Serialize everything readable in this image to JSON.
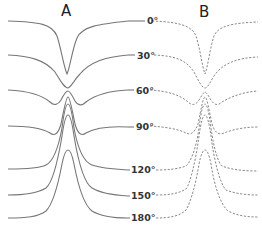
{
  "chart_data": {
    "type": "line",
    "title": "",
    "panels": [
      {
        "id": "A",
        "label": "A",
        "style": "solid",
        "description": "measured spectra"
      },
      {
        "id": "B",
        "label": "B",
        "style": "dashed",
        "description": "simulated spectra"
      }
    ],
    "xlabel": "",
    "ylabel": "",
    "grid": false,
    "legend": "none",
    "series_labels": [
      "0°",
      "30°",
      "60°",
      "90°",
      "120°",
      "150°",
      "180°"
    ],
    "series": [
      {
        "name": "0°",
        "shape": "dip",
        "depth": 1.0,
        "baseline_y": 21
      },
      {
        "name": "30°",
        "shape": "dip",
        "depth": 0.6,
        "baseline_y": 55
      },
      {
        "name": "60°",
        "shape": "dip-peak",
        "depth": 0.3,
        "baseline_y": 90
      },
      {
        "name": "90°",
        "shape": "peak",
        "height": 0.9,
        "baseline_y": 126
      },
      {
        "name": "120°",
        "shape": "peak",
        "height": 1.0,
        "baseline_y": 169
      },
      {
        "name": "150°",
        "shape": "peak",
        "height": 1.0,
        "baseline_y": 195
      },
      {
        "name": "180°",
        "shape": "peak",
        "height": 0.9,
        "baseline_y": 218
      }
    ]
  },
  "panel_a": {
    "title": "A",
    "paths": [
      "M8,21 C40,22 52,24 57,36 C61,48 64,68 67,74 C70,68 72,50 77,38 C82,26 100,24 128,21",
      "M8,55 C30,56 45,60 55,72 C60,80 64,88 68,88 C72,86 74,80 80,74 C90,62 105,57 128,55",
      "M8,90 C28,91 42,95 50,102 C54,106 58,105 61,100 C64,94 66,91 68,91 C70,91 72,95 75,101 C78,106 82,106 86,102 C95,95 108,91 128,90",
      "M8,126 C28,126 42,128 50,133 C54,136 58,135 61,124 C64,110 66,97 68,97 C70,97 72,110 75,124 C78,135 82,136 86,133 C95,128 110,126 128,127",
      "M8,169 C30,169 40,168 46,165 C52,162 58,150 62,128 C64,112 66,104 68,104 C70,104 72,112 74,128 C78,150 84,162 92,165 C100,168 112,169 128,170",
      "M8,195 C26,195 38,193 46,188 C52,183 58,160 62,136 C64,122 66,115 68,115 C70,115 72,122 74,136 C78,160 84,183 92,188 C100,193 112,195 128,196",
      "M8,218 C26,218 38,217 46,211 C52,205 58,185 62,164 C64,154 66,150 68,150 C70,150 72,154 74,164 C78,185 84,205 92,211 C100,216 112,218 128,218"
    ]
  },
  "panel_b": {
    "title": "B",
    "paths": [
      "M152,21 C180,22 192,26 196,36 C200,48 202,66 205,74 C208,66 210,48 214,36 C218,26 232,23 258,22",
      "M154,55 C176,56 186,60 194,72 C198,80 202,88 205,88 C208,88 210,82 214,76 C222,64 236,58 258,57",
      "M150,90 C168,91 180,95 188,102 C192,106 196,105 199,100 C202,95 204,92 205,92 C206,92 208,95 211,100 C214,105 218,106 222,102 C232,96 244,92 258,91",
      "M150,126 C166,127 178,129 186,133 C190,135 194,134 198,124 C201,110 203,97 205,97 C207,97 209,110 212,124 C215,134 220,135 224,133 C234,129 246,127 258,127",
      "M156,170 C168,170 178,169 186,166 C190,163 196,150 199,128 C201,112 203,104 205,104 C207,104 209,112 211,128 C214,150 218,162 222,166 C232,170 246,171 258,171",
      "M156,195 C168,195 178,194 186,189 C190,184 196,160 199,136 C201,122 203,115 205,115 C207,115 209,122 211,136 C214,160 220,184 226,190 C236,194 248,195 258,195",
      "M156,218 C170,218 180,216 186,210 C190,204 196,184 199,164 C201,154 203,150 205,150 C207,150 209,154 211,164 C214,184 220,204 228,211 C238,216 248,217 258,217"
    ]
  },
  "labels": [
    {
      "text": "0°",
      "x": 147,
      "y": 24
    },
    {
      "text": "30°",
      "x": 137,
      "y": 59
    },
    {
      "text": "60°",
      "x": 136,
      "y": 94
    },
    {
      "text": "90°",
      "x": 136,
      "y": 130
    },
    {
      "text": "120°",
      "x": 131,
      "y": 173
    },
    {
      "text": "150°",
      "x": 131,
      "y": 199
    },
    {
      "text": "180°",
      "x": 131,
      "y": 220
    }
  ],
  "connector_stubs": [
    "M128,21 L145,21",
    "M128,55 L135,55",
    "M128,90 L134,90",
    "M128,127 L134,127",
    "M128,170 L130,170",
    "M128,196 L130,196",
    "M128,218 L130,218"
  ]
}
